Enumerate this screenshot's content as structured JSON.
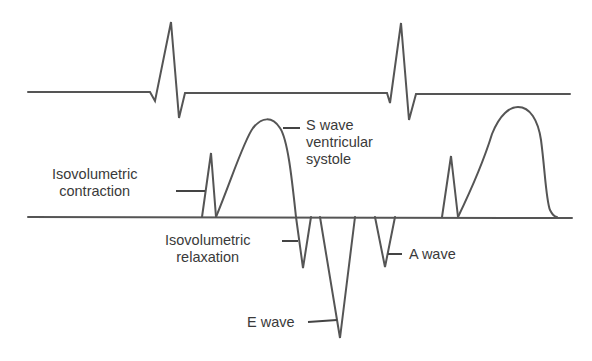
{
  "diagram": {
    "type": "ECG and Doppler mitral/ventricular flow timing diagram",
    "colors": {
      "trace": "#555555",
      "text": "#3a3a3a",
      "background": "#ffffff"
    },
    "ecg_trace": {
      "name": "ECG",
      "beats": 2
    },
    "doppler_trace": {
      "name": "Doppler flow",
      "cycles": 2
    },
    "labels": {
      "isovolumetric_contraction": {
        "line1": "Isovolumetric",
        "line2": "contraction"
      },
      "s_wave": {
        "line1": "S wave",
        "line2": "ventricular",
        "line3": "systole"
      },
      "isovolumetric_relaxation": {
        "line1": "Isovolumetric",
        "line2": "relaxation"
      },
      "e_wave": {
        "line1": "E wave"
      },
      "a_wave": {
        "line1": "A wave"
      }
    }
  }
}
